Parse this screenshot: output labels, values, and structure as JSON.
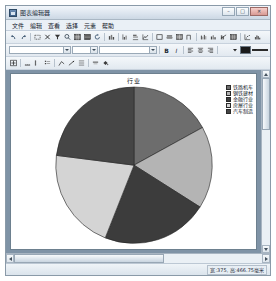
{
  "window": {
    "title": "图表编辑器",
    "icon": "chart-app-icon",
    "controls": {
      "minimize": "–",
      "maximize": "□",
      "close": "✕"
    }
  },
  "menu": {
    "items": [
      {
        "label": "文件",
        "name": "menu-file"
      },
      {
        "label": "编辑",
        "name": "menu-edit"
      },
      {
        "label": "查看",
        "name": "menu-view"
      },
      {
        "label": "选择",
        "name": "menu-select"
      },
      {
        "label": "元素",
        "name": "menu-element"
      },
      {
        "label": "帮助",
        "name": "menu-help"
      }
    ]
  },
  "toolbar_main": {
    "items": [
      {
        "name": "undo-icon",
        "glyph": "↶"
      },
      {
        "name": "redo-icon",
        "glyph": "↷"
      },
      {
        "sep": true
      },
      {
        "name": "select-rect-icon",
        "glyph": "▭"
      },
      {
        "name": "cut-icon",
        "glyph": "✂"
      },
      {
        "name": "filter-icon",
        "glyph": "▼"
      },
      {
        "name": "zoom-icon",
        "glyph": "⌕"
      },
      {
        "name": "grid-icon",
        "glyph": "▦"
      },
      {
        "name": "table-icon",
        "glyph": "▤"
      },
      {
        "name": "refresh-icon",
        "glyph": "↻"
      },
      {
        "sep": true
      },
      {
        "name": "chart-bar-icon",
        "glyph": "▥"
      },
      {
        "sep": true
      },
      {
        "name": "chart-column-icon",
        "glyph": "▮"
      },
      {
        "name": "chart-bar-h-icon",
        "glyph": "▬"
      },
      {
        "name": "chart-line-icon",
        "glyph": "∠"
      },
      {
        "sep": true
      },
      {
        "name": "chart-area-icon",
        "glyph": "◻"
      },
      {
        "name": "chart-stack-icon",
        "glyph": "▭"
      },
      {
        "name": "chart-grid-icon",
        "glyph": "⊞"
      },
      {
        "name": "chart-step-icon",
        "glyph": "⌐"
      },
      {
        "sep": true
      },
      {
        "name": "chart-group-icon",
        "glyph": "⊪"
      },
      {
        "name": "chart-mixed-icon",
        "glyph": "▩"
      },
      {
        "name": "chart-pareto-icon",
        "glyph": "⊔"
      },
      {
        "name": "chart-combo-icon",
        "glyph": "▦"
      },
      {
        "sep": true
      },
      {
        "name": "chart-scatter-icon",
        "glyph": "⁖"
      },
      {
        "name": "chart-hist-icon",
        "glyph": "⊞"
      }
    ]
  },
  "toolbar_format": {
    "font_family": "",
    "font_family_placeholder": "",
    "font_size": "",
    "font_size_placeholder": "",
    "buttons": [
      {
        "name": "bold-button",
        "glyph": "B"
      },
      {
        "name": "italic-button",
        "glyph": "I"
      },
      {
        "sep": true
      },
      {
        "name": "align-left-button",
        "glyph": "≡"
      },
      {
        "name": "align-center-button",
        "glyph": "≡"
      },
      {
        "name": "align-right-button",
        "glyph": "≡"
      },
      {
        "sep": true
      },
      {
        "name": "font-color-button",
        "glyph": "A"
      }
    ],
    "fill_color": "#1b1b1b",
    "line_style_name": "line-style-picker"
  },
  "toolbar_elements": {
    "items": [
      {
        "name": "chart-plus-icon",
        "glyph": "⊞"
      },
      {
        "sep": true
      },
      {
        "name": "axis-x-icon",
        "glyph": "⊥"
      },
      {
        "name": "axis-y-icon",
        "glyph": "⊢"
      },
      {
        "name": "legend-icon",
        "glyph": "▤"
      },
      {
        "sep": true
      },
      {
        "name": "data-label-icon",
        "glyph": "∠"
      },
      {
        "name": "trendline-icon",
        "glyph": "↗"
      },
      {
        "name": "gridline-icon",
        "glyph": "▦"
      },
      {
        "sep": true
      },
      {
        "name": "title-icon",
        "glyph": "▬"
      },
      {
        "name": "fill-bucket-icon",
        "glyph": "◗"
      }
    ]
  },
  "chart_data": {
    "type": "pie",
    "title": "行业",
    "xlabel": "",
    "ylabel": "",
    "legend_position": "right",
    "grid": false,
    "categories": [
      "铁路机车",
      "钢铁建材",
      "金融行业",
      "房屋行业",
      "汽车制造"
    ],
    "values": [
      17,
      17,
      22,
      21,
      23
    ],
    "start_angle_deg": 0,
    "colors": [
      "#6d6d6d",
      "#b4b4b4",
      "#3c3c3c",
      "#d4d4d4",
      "#454545"
    ],
    "legend_entries": [
      {
        "label": "铁路机车",
        "color": "#6d6d6d"
      },
      {
        "label": "钢铁建材",
        "color": "#b4b4b4"
      },
      {
        "label": "金融行业",
        "color": "#3c3c3c"
      },
      {
        "label": "房屋行业",
        "color": "#d4d4d4"
      },
      {
        "label": "汽车制造",
        "color": "#454545"
      }
    ]
  },
  "statusbar": {
    "dimensions": "宽:375, 高:466.75毫米"
  }
}
